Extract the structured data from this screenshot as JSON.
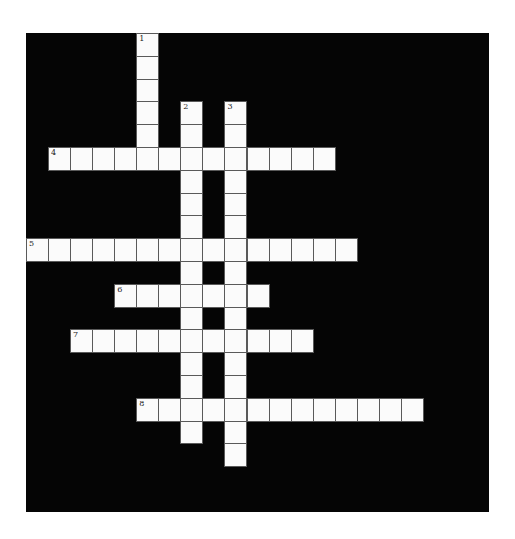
{
  "puzzle": {
    "grid": {
      "cols": 21,
      "rows": 21,
      "cell_width": 22.05,
      "cell_height": 22.8
    },
    "colors": {
      "block": "#050505",
      "cell": "#fbfbfb",
      "gridline": "#5a5a5a",
      "page": "#ffffff"
    },
    "entries": [
      {
        "number": "1",
        "direction": "down",
        "row": 0,
        "col": 5,
        "length": 6
      },
      {
        "number": "2",
        "direction": "down",
        "row": 3,
        "col": 7,
        "length": 15
      },
      {
        "number": "3",
        "direction": "down",
        "row": 3,
        "col": 9,
        "length": 16
      },
      {
        "number": "4",
        "direction": "across",
        "row": 5,
        "col": 1,
        "length": 13
      },
      {
        "number": "5",
        "direction": "across",
        "row": 9,
        "col": 0,
        "length": 15
      },
      {
        "number": "6",
        "direction": "across",
        "row": 11,
        "col": 4,
        "length": 7
      },
      {
        "number": "7",
        "direction": "across",
        "row": 13,
        "col": 2,
        "length": 11
      },
      {
        "number": "8",
        "direction": "across",
        "row": 16,
        "col": 5,
        "length": 13
      }
    ]
  }
}
